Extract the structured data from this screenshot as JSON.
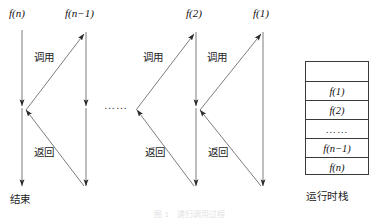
{
  "figure": {
    "title_caption": "图 1　递归调用过程",
    "width": 379,
    "height": 219,
    "line_color": "#3a3a3a",
    "text_color": "#111111"
  },
  "timelines": [
    {
      "id": "fn",
      "label_prefix": "f",
      "label_arg": "n",
      "label_full": "f(n)",
      "x": 22,
      "label_x": 9,
      "label_y": 14
    },
    {
      "id": "fn1",
      "label_prefix": "f",
      "label_arg": "n−1",
      "label_full": "f(n−1)",
      "x": 86,
      "label_x": 65,
      "label_y": 14
    },
    {
      "id": "f2",
      "label_prefix": "f",
      "label_arg": "2",
      "label_full": "f(2)",
      "x": 196,
      "label_x": 186,
      "label_y": 14
    },
    {
      "id": "f1",
      "label_prefix": "f",
      "label_arg": "1",
      "label_full": "f(1)",
      "x": 263,
      "label_x": 253,
      "label_y": 14
    }
  ],
  "labels": {
    "call": "调用",
    "return": "返回",
    "end": "结束",
    "ellipsis": "……",
    "stack_caption": "运行时栈"
  },
  "call_labels": [
    {
      "text": "调用",
      "x": 34,
      "y": 52
    },
    {
      "text": "调用",
      "x": 143,
      "y": 52
    },
    {
      "text": "调用",
      "x": 207,
      "y": 52
    }
  ],
  "return_labels": [
    {
      "text": "返回",
      "x": 34,
      "y": 147
    },
    {
      "text": "返回",
      "x": 145,
      "y": 147
    },
    {
      "text": "返回",
      "x": 208,
      "y": 147
    }
  ],
  "mid_ellipsis": {
    "text": "……",
    "x": 104,
    "y": 100
  },
  "end_label": {
    "text": "结束",
    "x": 10,
    "y": 194
  },
  "stack": {
    "caption": "运行时栈",
    "caption_x": 306,
    "caption_y": 191,
    "box": {
      "x": 305,
      "y": 61,
      "width": 64,
      "height": 114
    },
    "cells": [
      {
        "label": "",
        "is_dots": false,
        "empty": true
      },
      {
        "label": "f(1)",
        "prefix": "f",
        "arg": "1",
        "is_dots": false
      },
      {
        "label": "f(2)",
        "prefix": "f",
        "arg": "2",
        "is_dots": false
      },
      {
        "label": "……",
        "is_dots": true
      },
      {
        "label": "f(n−1)",
        "prefix": "f",
        "arg": "n−1",
        "is_dots": false
      },
      {
        "label": "f(n)",
        "prefix": "f",
        "arg": "n",
        "is_dots": false
      }
    ]
  }
}
